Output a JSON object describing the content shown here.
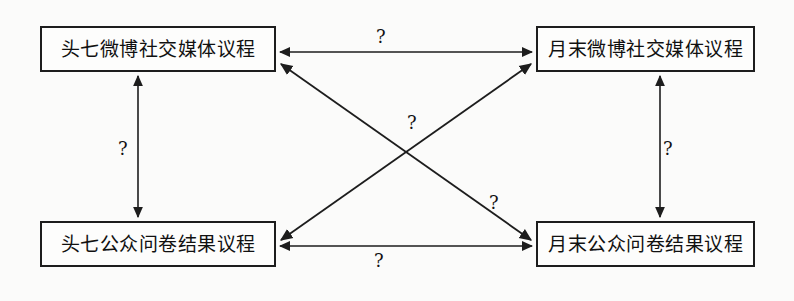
{
  "diagram": {
    "type": "cross-lagged-panel-path-diagram",
    "background_color": "#fbfbfa",
    "line_color": "#1d1d1d",
    "nodes": [
      {
        "id": "tl",
        "label": "头七微博社交媒体议程",
        "position": "top-left"
      },
      {
        "id": "tr",
        "label": "月末微博社交媒体议程",
        "position": "top-right"
      },
      {
        "id": "bl",
        "label": "头七公众问卷结果议程",
        "position": "bottom-left"
      },
      {
        "id": "br",
        "label": "月末公众问卷结果议程",
        "position": "bottom-right"
      }
    ],
    "edges": [
      {
        "id": "top",
        "from": "tl",
        "to": "tr",
        "style": "bidirectional-horizontal",
        "label": "?"
      },
      {
        "id": "bottom",
        "from": "bl",
        "to": "br",
        "style": "bidirectional-horizontal",
        "label": "?"
      },
      {
        "id": "left",
        "from": "tl",
        "to": "bl",
        "style": "bidirectional-vertical",
        "label": "?"
      },
      {
        "id": "right",
        "from": "tr",
        "to": "br",
        "style": "bidirectional-vertical",
        "label": "?"
      },
      {
        "id": "diag-center",
        "from": "bl",
        "to": "tr",
        "style": "bidirectional-diagonal",
        "label": "?"
      },
      {
        "id": "diag-lower",
        "from": "tl",
        "to": "br",
        "style": "bidirectional-diagonal",
        "label": "?"
      }
    ]
  }
}
